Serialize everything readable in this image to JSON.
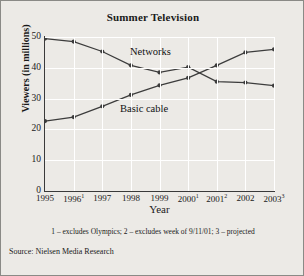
{
  "chart_data": {
    "type": "line",
    "title": "Summer Television",
    "xlabel": "Year",
    "ylabel": "Viewers (in millions)",
    "categories": [
      "1995",
      "1996",
      "1997",
      "1998",
      "1999",
      "2000",
      "2001",
      "2002",
      "2003"
    ],
    "tick_labels": [
      "1995",
      "1996",
      "1997",
      "1998",
      "1999",
      "2000",
      "2001",
      "2002",
      "2003"
    ],
    "tick_superscripts": [
      "",
      "1",
      "",
      "",
      "",
      "1",
      "2",
      "",
      "3"
    ],
    "ylim": [
      0,
      50
    ],
    "yticks": [
      0,
      10,
      20,
      30,
      40,
      50
    ],
    "grid": true,
    "legend": "inline-labels",
    "series": [
      {
        "name": "Networks",
        "values": [
          49.5,
          48.5,
          45.3,
          40.8,
          38.5,
          40.2,
          35.5,
          35.2,
          34.2
        ]
      },
      {
        "name": "Basic cable",
        "values": [
          22.7,
          24.0,
          27.5,
          31.2,
          34.3,
          36.7,
          40.8,
          45.0,
          46.0
        ]
      }
    ],
    "annotations": {
      "footnote": "1 – excludes Olympics; 2 – excludes week of 9/11/01; 3 – projected",
      "source": "Source: Nielsen Media Research"
    },
    "colors": {
      "line": "#3c3c3c",
      "background": "#eceae6",
      "grid": "#ffffff"
    }
  }
}
